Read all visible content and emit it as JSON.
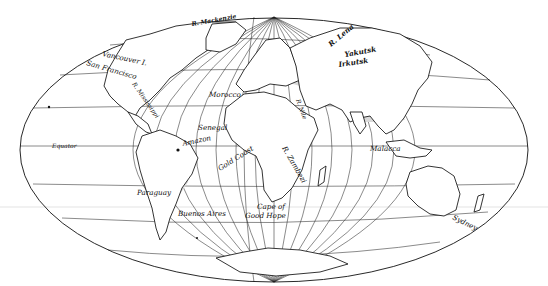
{
  "map": {
    "projection": "elliptical equal-area world map (Aitoff/Hammer style)",
    "style": "black-and-white line drawing with stippled gray regions",
    "colors": {
      "background": "#ffffff",
      "lines": "#111111",
      "shaded_regions": "#d9d9d9"
    },
    "labels": [
      {
        "id": "mackenzie",
        "text": "R. Mackenzie",
        "x": 192,
        "y": 26,
        "rotate": -10
      },
      {
        "id": "vancouver",
        "text": "Vancouver I.",
        "x": 108,
        "y": 56,
        "rotate": 12
      },
      {
        "id": "san-francisco",
        "text": "San Francisco",
        "x": 89,
        "y": 64,
        "rotate": 18
      },
      {
        "id": "mississippi",
        "text": "R. Mississippi",
        "x": 132,
        "y": 85,
        "rotate": 55
      },
      {
        "id": "morocco",
        "text": "Morocco",
        "x": 209,
        "y": 97,
        "rotate": 0
      },
      {
        "id": "senegal",
        "text": "Senegal",
        "x": 200,
        "y": 130,
        "rotate": 0
      },
      {
        "id": "amazon",
        "text": "Amazon",
        "x": 186,
        "y": 145,
        "rotate": -12
      },
      {
        "id": "equator",
        "text": "Equator",
        "x": 52,
        "y": 148,
        "rotate": 0
      },
      {
        "id": "gold-coast",
        "text": "Gold Coast",
        "x": 219,
        "y": 170,
        "rotate": -32
      },
      {
        "id": "nile",
        "text": "R. Nile",
        "x": 296,
        "y": 102,
        "rotate": 70
      },
      {
        "id": "zambezi",
        "text": "R. Zambezi",
        "x": 282,
        "y": 148,
        "rotate": 60
      },
      {
        "id": "lena",
        "text": "R. Lena",
        "x": 331,
        "y": 45,
        "rotate": -40
      },
      {
        "id": "yakutsk",
        "text": "Yakutsk",
        "x": 345,
        "y": 57,
        "rotate": -12
      },
      {
        "id": "irkutsk",
        "text": "Irkutsk",
        "x": 340,
        "y": 66,
        "rotate": -10
      },
      {
        "id": "malacca",
        "text": "Malacca",
        "x": 371,
        "y": 151,
        "rotate": 0
      },
      {
        "id": "paraguay",
        "text": "Paraguay",
        "x": 137,
        "y": 194,
        "rotate": 0
      },
      {
        "id": "buenos-aires",
        "text": "Buenos Aires",
        "x": 178,
        "y": 216,
        "rotate": 0
      },
      {
        "id": "cape-1",
        "text": "Cape of",
        "x": 257,
        "y": 209,
        "rotate": 0
      },
      {
        "id": "cape-2",
        "text": "Good Hope",
        "x": 246,
        "y": 218,
        "rotate": 0
      },
      {
        "id": "sydney",
        "text": "Sydney",
        "x": 452,
        "y": 220,
        "rotate": 28
      }
    ]
  }
}
